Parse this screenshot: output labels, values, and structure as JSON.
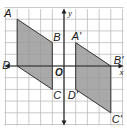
{
  "diagram": {
    "type": "coordinate-grid-translation",
    "grid": {
      "xmin": -5,
      "xmax": 5,
      "ymin": -5,
      "ymax": 5,
      "unit_px": 11.7,
      "origin_px": [
        64,
        66
      ]
    },
    "axes": {
      "x_label": "x",
      "y_label": "y",
      "origin_label": "O"
    },
    "fill_color": "#9a9a9a",
    "stroke_color": "#333333",
    "grid_color": "#bdbdbd",
    "shapes": [
      {
        "name": "ABCD",
        "vertices": [
          {
            "label": "A",
            "x": -4,
            "y": 4
          },
          {
            "label": "B",
            "x": -1,
            "y": 2
          },
          {
            "label": "C",
            "x": -1,
            "y": -2
          },
          {
            "label": "D",
            "x": -4,
            "y": 0
          }
        ]
      },
      {
        "name": "A'B'C'D'",
        "vertices": [
          {
            "label": "A'",
            "x": 1,
            "y": 2
          },
          {
            "label": "B'",
            "x": 4,
            "y": 0
          },
          {
            "label": "C'",
            "x": 4,
            "y": -4
          },
          {
            "label": "D'",
            "x": 1,
            "y": -2
          }
        ]
      }
    ]
  }
}
